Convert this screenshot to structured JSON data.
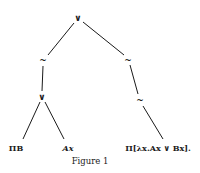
{
  "diagram": {
    "type": "tree",
    "nodes": {
      "root": {
        "label": "∨",
        "x": 78,
        "y": 18
      },
      "left_neg": {
        "label": "~",
        "x": 43,
        "y": 60
      },
      "right_neg1": {
        "label": "~",
        "x": 128,
        "y": 60
      },
      "left_or": {
        "label": "∨",
        "x": 42,
        "y": 97
      },
      "right_neg2": {
        "label": "~",
        "x": 140,
        "y": 100
      },
      "leaf_pi_b": {
        "label": "ΠB",
        "x": 16,
        "y": 148
      },
      "leaf_ax": {
        "label": "Ax",
        "x": 68,
        "y": 148
      },
      "leaf_pi_lambda": {
        "label": "Π[λx.Ax ∨ Bx].",
        "x": 158,
        "y": 148
      }
    },
    "edges": [
      [
        "root",
        "left_neg"
      ],
      [
        "root",
        "right_neg1"
      ],
      [
        "left_neg",
        "left_or"
      ],
      [
        "right_neg1",
        "right_neg2"
      ],
      [
        "left_or",
        "leaf_pi_b"
      ],
      [
        "left_or",
        "leaf_ax"
      ],
      [
        "right_neg2",
        "leaf_pi_lambda"
      ]
    ]
  },
  "caption": "Figure 1"
}
